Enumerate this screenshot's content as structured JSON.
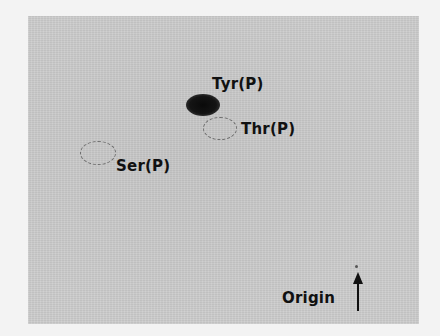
{
  "figure": {
    "type": "phosphoamino acid analysis (TLC autoradiograph)",
    "background_color": "#cdcdcd",
    "page_color": "#f3f3f3",
    "labels": {
      "tyr": "Tyr(P)",
      "thr": "Thr(P)",
      "ser": "Ser(P)",
      "origin": "Origin"
    },
    "spots": [
      {
        "name": "Tyr(P)",
        "style": "dark-filled",
        "color": "#111111",
        "center": [
          203,
          105
        ]
      },
      {
        "name": "Thr(P)",
        "style": "dashed-outline",
        "color": "#6e6e6e",
        "center": [
          220,
          128
        ]
      },
      {
        "name": "Ser(P)",
        "style": "dashed-outline",
        "color": "#6e6e6e",
        "center": [
          98,
          153
        ]
      }
    ],
    "origin_marker": {
      "position": [
        356,
        266
      ],
      "arrow_direction": "up"
    }
  }
}
